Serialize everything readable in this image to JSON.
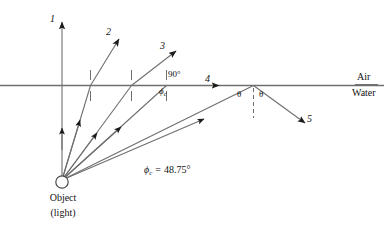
{
  "diagram": {
    "media": {
      "upper_label": "Air",
      "lower_label": "Water"
    },
    "source": {
      "label_line1": "Object",
      "label_line2": "(light)",
      "icon": "light-source-circle"
    },
    "rays": [
      {
        "id": "1",
        "label": "1",
        "description": "normal-incidence ray, refracts straight up"
      },
      {
        "id": "2",
        "label": "2",
        "description": "small incidence angle, refracts away from normal"
      },
      {
        "id": "3",
        "label": "3",
        "description": "larger incidence angle, refracts further from normal"
      },
      {
        "id": "4",
        "label": "4",
        "description": "incidence at critical angle, refracts along surface at 90 degrees"
      },
      {
        "id": "5",
        "label": "5",
        "description": "incidence beyond critical angle, totally internally reflected"
      }
    ],
    "angle_labels": {
      "ninety": "90°",
      "phi_c_symbol": "ϕ",
      "phi_c_subscript": "c",
      "theta_incident": "θ",
      "theta_reflected": "θ"
    },
    "equation": {
      "symbol": "ϕ",
      "subscript": "c",
      "operator": "=",
      "value": "48.75°",
      "full_text": "ϕc = 48.75°"
    },
    "colors": {
      "line": "#6f6f6f",
      "ink": "#111111",
      "background": "#ffffff"
    }
  }
}
